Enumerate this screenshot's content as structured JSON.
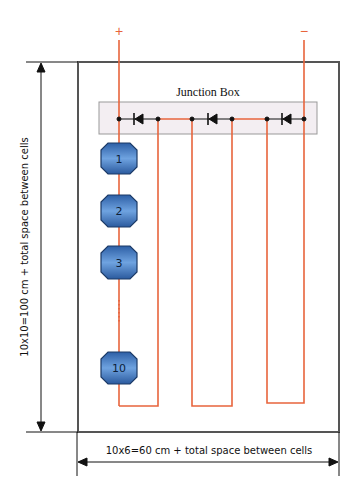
{
  "diagram": {
    "junction_box_label": "Junction Box",
    "positive_terminal": "+",
    "negative_terminal": "−",
    "vertical_dimension_label": "10x10=100 cm + total space between cells",
    "horizontal_dimension_label": "10x6=60 cm + total space between cells",
    "cells": [
      {
        "label": "1"
      },
      {
        "label": "2"
      },
      {
        "label": "3"
      },
      {
        "label": "10"
      }
    ],
    "colors": {
      "wire": "#e8643c",
      "frame": "#555555",
      "junction_box_fill": "#f3eef2",
      "cell_fill": "#3a6fb8",
      "cell_stroke": "#1c3a66"
    }
  }
}
